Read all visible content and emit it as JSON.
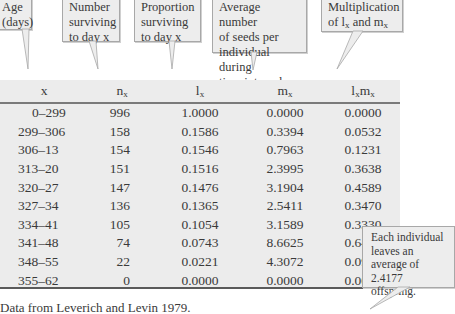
{
  "callouts": {
    "age": [
      "Age",
      "(days)"
    ],
    "number": [
      "Number",
      "surviving",
      "to day x"
    ],
    "proportion": [
      "Proportion",
      "surviving",
      "to day x"
    ],
    "average": [
      "Average number",
      "of seeds per",
      "individual during",
      "time interval"
    ],
    "multiplication": {
      "line1": "Multiplication",
      "line2_pre": "of l",
      "sub1": "x",
      "mid": " and m",
      "sub2": "x"
    },
    "summary": [
      "Each individual",
      "leaves an",
      "average of",
      "2.4177 offspring."
    ]
  },
  "table": {
    "headers": [
      {
        "main": "x",
        "sub": ""
      },
      {
        "main": "n",
        "sub": "x"
      },
      {
        "main": "l",
        "sub": "x"
      },
      {
        "main": "m",
        "sub": "x"
      },
      {
        "main": "l",
        "sub": "x",
        "main2": "m",
        "sub2": "x"
      }
    ],
    "rows": [
      [
        "0–299",
        "996",
        "1.0000",
        "0.0000",
        "0.0000"
      ],
      [
        "299–306",
        "158",
        "0.1586",
        "0.3394",
        "0.0532"
      ],
      [
        "306–13",
        "154",
        "0.1546",
        "0.7963",
        "0.1231"
      ],
      [
        "313–20",
        "151",
        "0.1516",
        "2.3995",
        "0.3638"
      ],
      [
        "320–27",
        "147",
        "0.1476",
        "3.1904",
        "0.4589"
      ],
      [
        "327–34",
        "136",
        "0.1365",
        "2.5411",
        "0.3470"
      ],
      [
        "334–41",
        "105",
        "0.1054",
        "3.1589",
        "0.3330"
      ],
      [
        "341–48",
        "74",
        "0.0743",
        "8.6625",
        "0.6436"
      ],
      [
        "348–55",
        "22",
        "0.0221",
        "4.3072",
        "0.0951"
      ],
      [
        "355–62",
        "0",
        "0.0000",
        "0.0000",
        "0.0000"
      ]
    ]
  },
  "caption": "Data from Leverich and Levin 1979.",
  "colors": {
    "table_bg": "#ececec",
    "callout_bg": "#ededed",
    "rule": "#5a5a5a"
  }
}
